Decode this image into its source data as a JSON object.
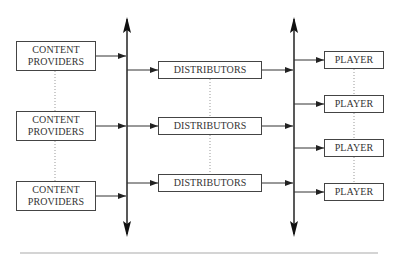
{
  "diagram": {
    "content_providers": [
      {
        "line1": "CONTENT",
        "line2": "PROVIDERS"
      },
      {
        "line1": "CONTENT",
        "line2": "PROVIDERS"
      },
      {
        "line1": "CONTENT",
        "line2": "PROVIDERS"
      }
    ],
    "distributors": [
      {
        "label": "DISTRIBUTORS"
      },
      {
        "label": "DISTRIBUTORS"
      },
      {
        "label": "DISTRIBUTORS"
      }
    ],
    "players": [
      {
        "label": "PLAYER"
      },
      {
        "label": "PLAYER"
      },
      {
        "label": "PLAYER"
      },
      {
        "label": "PLAYER"
      }
    ],
    "colors": {
      "line": "#333333",
      "box_border": "#444444",
      "text": "#333333",
      "dotted": "#999999",
      "rule": "#aaaaaa"
    }
  }
}
